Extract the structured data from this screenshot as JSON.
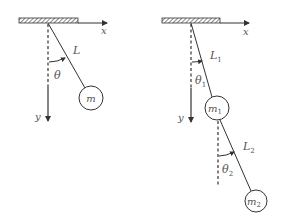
{
  "diagram": {
    "colors": {
      "line": "#333333",
      "hatch_fill": "#666666",
      "label": "#555555",
      "background": "#ffffff"
    },
    "single_pendulum": {
      "x_label": "x",
      "y_label": "y",
      "length_label": "L",
      "angle_label": "θ",
      "mass_label": "m"
    },
    "double_pendulum": {
      "x_label": "x",
      "y_label": "y",
      "length1_label": "L",
      "length1_sub": "1",
      "angle1_label": "θ",
      "angle1_sub": "1",
      "mass1_label": "m",
      "mass1_sub": "1",
      "length2_label": "L",
      "length2_sub": "2",
      "angle2_label": "θ",
      "angle2_sub": "2",
      "mass2_label": "m",
      "mass2_sub": "2"
    }
  }
}
